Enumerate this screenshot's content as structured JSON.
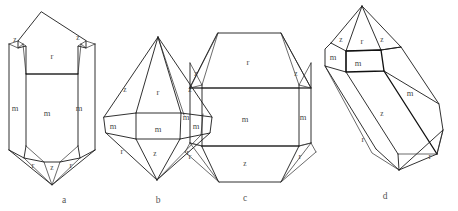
{
  "figure": {
    "background_color": "#ffffff",
    "line_color": "#1a1a1a",
    "label_color": "#4a4a4a",
    "caption_color": "#555555",
    "width": 458,
    "height": 211
  },
  "crystals": [
    {
      "id": "a",
      "caption": "a",
      "caption_x": 64,
      "caption_y": 201,
      "description": "Prismatic quartz crystal with rhombohedral terminations at both ends",
      "labels": [
        {
          "text": "z",
          "x": 15,
          "y": 40,
          "size": "small"
        },
        {
          "text": "r",
          "x": 52,
          "y": 57,
          "size": "normal"
        },
        {
          "text": "z",
          "x": 78,
          "y": 38,
          "size": "small"
        },
        {
          "text": "m",
          "x": 15,
          "y": 109,
          "size": "normal"
        },
        {
          "text": "m",
          "x": 47,
          "y": 114,
          "size": "normal"
        },
        {
          "text": "m",
          "x": 79,
          "y": 109,
          "size": "normal"
        },
        {
          "text": "r",
          "x": 33,
          "y": 166,
          "size": "normal"
        },
        {
          "text": "z",
          "x": 52,
          "y": 168,
          "size": "small"
        },
        {
          "text": "r",
          "x": 71,
          "y": 166,
          "size": "normal"
        }
      ]
    },
    {
      "id": "b",
      "caption": "b",
      "caption_x": 158,
      "caption_y": 201,
      "description": "Short bipyramidal quartz crystal, nearly rhombohedral habit with narrow prism zone",
      "labels": [
        {
          "text": "z",
          "x": 125,
          "y": 90,
          "size": "small"
        },
        {
          "text": "r",
          "x": 158,
          "y": 93,
          "size": "normal"
        },
        {
          "text": "z",
          "x": 190,
          "y": 90,
          "size": "small"
        },
        {
          "text": "m",
          "x": 113,
          "y": 127,
          "size": "normal"
        },
        {
          "text": "m",
          "x": 158,
          "y": 130,
          "size": "normal"
        },
        {
          "text": "m",
          "x": 196,
          "y": 127,
          "size": "normal"
        },
        {
          "text": "r",
          "x": 122,
          "y": 152,
          "size": "normal"
        },
        {
          "text": "z",
          "x": 155,
          "y": 154,
          "size": "small"
        },
        {
          "text": "r",
          "x": 188,
          "y": 153,
          "size": "normal"
        }
      ]
    },
    {
      "id": "c",
      "caption": "c",
      "caption_x": 245,
      "caption_y": 199,
      "description": "Stout equant quartz crystal with broad prism faces and flattened rhombohedral terminations",
      "labels": [
        {
          "text": "r",
          "x": 248,
          "y": 63,
          "size": "normal"
        },
        {
          "text": "z",
          "x": 196,
          "y": 74,
          "size": "small"
        },
        {
          "text": "z",
          "x": 296,
          "y": 74,
          "size": "small"
        },
        {
          "text": "m",
          "x": 186,
          "y": 118,
          "size": "normal"
        },
        {
          "text": "m",
          "x": 245,
          "y": 120,
          "size": "normal"
        },
        {
          "text": "m",
          "x": 303,
          "y": 118,
          "size": "normal"
        },
        {
          "text": "r",
          "x": 190,
          "y": 157,
          "size": "normal"
        },
        {
          "text": "z",
          "x": 245,
          "y": 164,
          "size": "small"
        },
        {
          "text": "r",
          "x": 300,
          "y": 157,
          "size": "normal"
        }
      ]
    },
    {
      "id": "d",
      "caption": "d",
      "caption_x": 385,
      "caption_y": 197,
      "description": "Elongated prismatic quartz crystal shown in oblique perspective view",
      "labels": [
        {
          "text": "z",
          "x": 341,
          "y": 40,
          "size": "small"
        },
        {
          "text": "r",
          "x": 362,
          "y": 42,
          "size": "normal"
        },
        {
          "text": "z",
          "x": 382,
          "y": 40,
          "size": "small"
        },
        {
          "text": "m",
          "x": 333,
          "y": 58,
          "size": "normal"
        },
        {
          "text": "m",
          "x": 358,
          "y": 64,
          "size": "normal"
        },
        {
          "text": "m",
          "x": 410,
          "y": 94,
          "size": "normal"
        },
        {
          "text": "z",
          "x": 382,
          "y": 114,
          "size": "small"
        },
        {
          "text": "r",
          "x": 363,
          "y": 140,
          "size": "normal"
        },
        {
          "text": "r",
          "x": 430,
          "y": 157,
          "size": "normal"
        }
      ]
    }
  ],
  "face_symbols": {
    "r": "positive rhombohedron",
    "z": "negative rhombohedron",
    "m": "hexagonal prism"
  }
}
